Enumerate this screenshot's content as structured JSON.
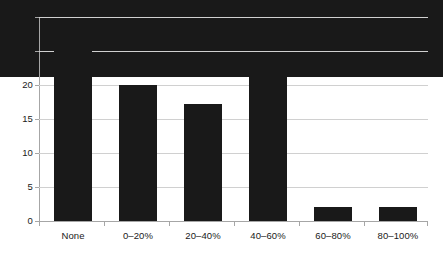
{
  "chart_data": {
    "type": "bar",
    "title": "",
    "subtitle": "",
    "xlabel": "",
    "ylabel": "",
    "categories": [
      "None",
      "0–20%",
      "20–40%",
      "40–60%",
      "60–80%",
      "80–100%"
    ],
    "values": [
      11.3,
      27.8,
      20.0,
      17.2,
      21.8,
      2.0
    ],
    "series": [
      {
        "name": "",
        "values": [
          11.3,
          27.8,
          20.0,
          17.2,
          21.8,
          2.0
        ]
      }
    ],
    "ylim": [
      0,
      30
    ],
    "y_ticks": [
      0,
      5,
      10,
      15,
      20,
      25,
      30
    ],
    "y_tick_labels": [
      "0",
      "5",
      "10",
      "15",
      "20",
      "25",
      "30"
    ],
    "grid": "horizontal",
    "legend": "none",
    "legend_position": "none",
    "bar_color": "#191919",
    "gridline_color": "#d0d0d0",
    "axis_color": "#a6a6a6",
    "background_color": "#ffffff",
    "annotations": []
  }
}
